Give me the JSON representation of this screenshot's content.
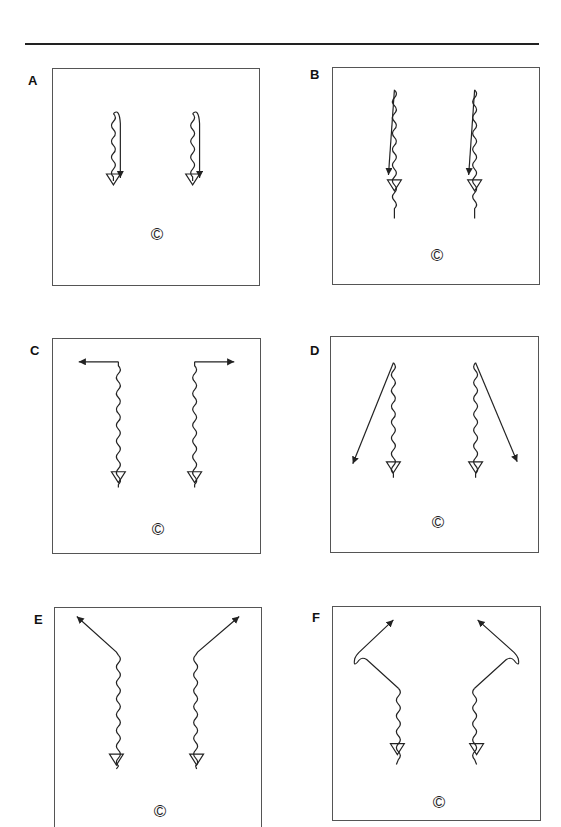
{
  "header": {
    "rule": true
  },
  "panels": [
    {
      "id": "A",
      "label": "A",
      "coach_symbol": "©",
      "description": "Two players dribble down (wavy) then curl back with a short solid run ending at a cone"
    },
    {
      "id": "B",
      "label": "B",
      "coach_symbol": "©",
      "description": "Two players dribble long wavy line down to cone, solid straight run alongside"
    },
    {
      "id": "C",
      "label": "C",
      "coach_symbol": "©",
      "description": "Wavy dribble down to cones; solid runs out sideways at top (left player left, right player right)"
    },
    {
      "id": "D",
      "label": "D",
      "coach_symbol": "©",
      "description": "Wavy dribble down to cones; solid diagonal runs outward-down from the top"
    },
    {
      "id": "E",
      "label": "E",
      "coach_symbol": "©",
      "description": "Wavy dribble down to cones; solid diagonal runs outward-up from the top of the dribble"
    },
    {
      "id": "F",
      "label": "F",
      "coach_symbol": "©",
      "description": "Wavy dribble to cones; solid run diagonally outward, loop, then diagonally up-inward"
    }
  ],
  "colors": {
    "ink": "#222222",
    "border": "#555555",
    "background": "#ffffff"
  }
}
